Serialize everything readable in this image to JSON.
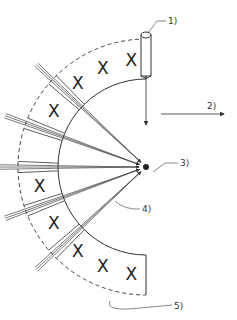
{
  "labels": {
    "l1": "1)",
    "l2": "2)",
    "l3": "3)",
    "l4": "4)",
    "l5": "5)"
  },
  "marker": "X",
  "center": {
    "x": 146,
    "y": 167
  },
  "radii": {
    "inner": 88,
    "outer": 128
  },
  "beam_angles_deg": [
    -137,
    -160,
    180,
    160,
    137
  ],
  "segments": [
    {
      "from": -90,
      "to": -137,
      "marks": 3
    },
    {
      "from": -137,
      "to": -160,
      "marks": 1
    },
    {
      "from": -160,
      "to": 180,
      "marks": 1
    },
    {
      "from": 180,
      "to": 160,
      "marks": 1
    },
    {
      "from": 160,
      "to": 137,
      "marks": 1
    },
    {
      "from": 137,
      "to": 90,
      "marks": 3
    }
  ]
}
